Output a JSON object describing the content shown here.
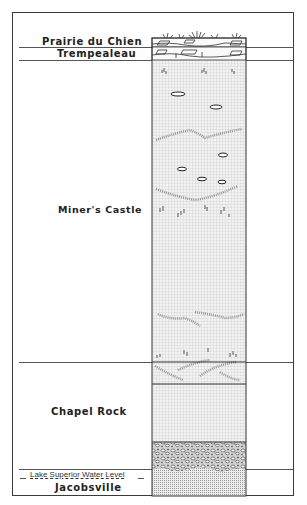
{
  "diagram": {
    "type": "stratigraphic-column",
    "formations": [
      {
        "name": "Prairie du Chien",
        "lithology": "dolomite with vegetation cover",
        "top_y": 38,
        "bottom_y": 47
      },
      {
        "name": "Trempealeau",
        "lithology": "dolomite / sandy dolomite",
        "top_y": 47,
        "bottom_y": 60
      },
      {
        "name": "Miner's Castle",
        "lithology": "sandstone with lenses, cross-bedding and burrows",
        "top_y": 60,
        "bottom_y": 362
      },
      {
        "name": "Chapel Rock",
        "lithology": "sandstone with basal conglomerate",
        "top_y": 362,
        "bottom_y": 469
      },
      {
        "name": "Jacobsville",
        "lithology": "fine sandstone",
        "top_y": 469,
        "bottom_y": 496
      }
    ],
    "annotations": {
      "water_level": "Lake Superior Water Level"
    },
    "colors": {
      "line": "#3a3a3a",
      "sandstone_fill": "#e4e4e4",
      "text": "#222222"
    }
  },
  "labels": {
    "prairie": "Prairie du Chien",
    "trempealeau": "Trempealeau",
    "miners": "Miner's Castle",
    "chapel": "Chapel Rock",
    "water": "Lake Superior Water Level",
    "jacobsville": "Jacobsville"
  }
}
